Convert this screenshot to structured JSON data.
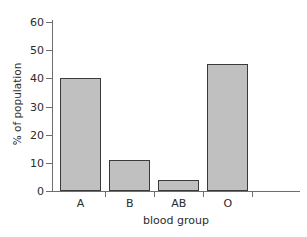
{
  "chart_data": {
    "type": "bar",
    "title": "",
    "categories": [
      "A",
      "B",
      "AB",
      "O"
    ],
    "values": [
      40,
      11,
      4,
      45
    ],
    "series": [
      {
        "name": "% of population",
        "values": [
          40,
          11,
          4,
          45
        ]
      }
    ],
    "xlabel": "blood group",
    "ylabel": "% of population",
    "ylim": [
      0,
      62
    ],
    "yticks": [
      0,
      10,
      20,
      30,
      40,
      50,
      60
    ],
    "ytick_labels": [
      "0",
      "10",
      "20",
      "30",
      "40",
      "50",
      "60"
    ],
    "xtick_labels": [
      "A",
      "B",
      "AB",
      "O"
    ],
    "grid": false,
    "legend": false,
    "bar_fill_color": "#c0c0c0",
    "bar_edge_color": "#3a3a3a",
    "axis_color": "#6e6e6e",
    "text_color": "#2b2b2b",
    "background_color": "#ffffff"
  }
}
